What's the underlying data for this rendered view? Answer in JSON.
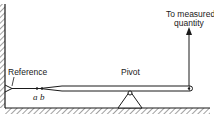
{
  "diagram": {
    "type": "mechanical-lever-indicator",
    "labels": {
      "reference": "Reference",
      "pivot": "Pivot",
      "measured_line1": "To measured",
      "measured_line2": "quantity",
      "point_a": "a",
      "point_b": "b"
    },
    "colors": {
      "ink": "#1a1a1a",
      "background": "#ffffff",
      "hatch": "#444444"
    }
  }
}
